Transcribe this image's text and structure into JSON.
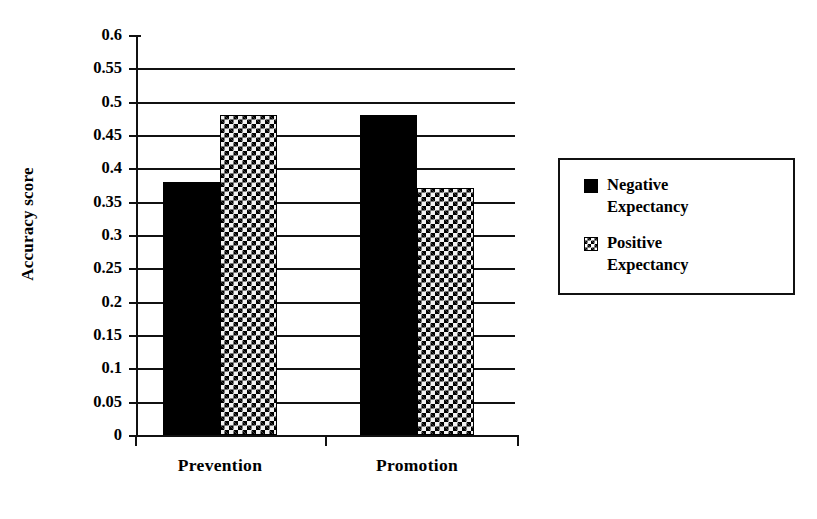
{
  "chart_data": {
    "type": "bar",
    "title": "",
    "subtitle": "",
    "xlabel": "",
    "ylabel": "Accuracy score",
    "categories": [
      "Prevention",
      "Promotion"
    ],
    "series": [
      {
        "name": "Negative Expectancy",
        "values": [
          0.38,
          0.48
        ],
        "fill": "solid-black",
        "color": "#000000"
      },
      {
        "name": "Positive Expectancy",
        "values": [
          0.48,
          0.37
        ],
        "fill": "checkerboard",
        "color": "#000000"
      }
    ],
    "ylim": [
      0,
      0.6
    ],
    "ytick_step": 0.05,
    "ytick_labels": [
      "0.6",
      "0.55",
      "0.5",
      "0.45",
      "0.4",
      "0.35",
      "0.3",
      "0.25",
      "0.2",
      "0.15",
      "0.1",
      "0.05",
      "0"
    ],
    "ytick_values": [
      0.6,
      0.55,
      0.5,
      0.45,
      0.4,
      0.35,
      0.3,
      0.25,
      0.2,
      0.15,
      0.1,
      0.05,
      0
    ],
    "grid": "horizontal",
    "grid_lines_at": [
      0.55,
      0.5,
      0.45,
      0.4,
      0.35,
      0.3,
      0.25,
      0.2,
      0.15,
      0.1,
      0.05,
      0
    ],
    "legend_position": "right",
    "legend_entries": [
      "Negative Expectancy",
      "Positive Expectancy"
    ],
    "annotations": []
  },
  "legend": {
    "items": [
      {
        "label_line1": "Negative",
        "label_line2": "Expectancy",
        "marker": "solid-square-icon"
      },
      {
        "label_line1": "Positive",
        "label_line2": "Expectancy",
        "marker": "checkered-square-icon"
      }
    ]
  },
  "colors": {
    "axis": "#111111",
    "negative_series": "#000000",
    "positive_series_light": "#f2f2f2",
    "background": "#ffffff"
  }
}
